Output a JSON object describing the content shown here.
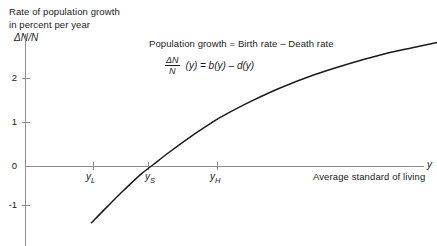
{
  "chart_data": {
    "type": "line",
    "title": "",
    "ylabel": "Rate of population growth in percent per year",
    "ylabel_symbol": "ΔN/N",
    "xlabel": "Average standard of living",
    "xlabel_symbol": "y",
    "ylim": [
      -1.55,
      2.95
    ],
    "xlim": [
      0,
      10
    ],
    "grid": false,
    "legend": null,
    "y_ticks": [
      {
        "value": 2,
        "label": "2"
      },
      {
        "value": 1,
        "label": "1"
      },
      {
        "value": 0,
        "label": "0"
      },
      {
        "value": -1,
        "label": "-1"
      }
    ],
    "x_ticks": [
      {
        "value": 1.7,
        "label": "y",
        "sub": "L"
      },
      {
        "value": 3.1,
        "label": "y",
        "sub": "S"
      },
      {
        "value": 4.8,
        "label": "y",
        "sub": "H"
      }
    ],
    "series": [
      {
        "name": "Population growth rate",
        "x": [
          1.6,
          2.0,
          2.4,
          2.8,
          3.1,
          3.5,
          4.0,
          4.5,
          4.8,
          5.5,
          6.2,
          7.0,
          7.8,
          8.6,
          9.4,
          10.0
        ],
        "values": [
          -1.28,
          -0.9,
          -0.53,
          -0.18,
          0.04,
          0.33,
          0.67,
          0.98,
          1.15,
          1.49,
          1.79,
          2.08,
          2.32,
          2.53,
          2.7,
          2.82
        ]
      }
    ],
    "annotations": {
      "statement": "Population growth = Birth rate – Death rate",
      "equation_numerator": "ΔN",
      "equation_denominator": "N",
      "equation_rhs": "(y) = b(y) – d(y)"
    },
    "colors": {
      "curve": "#1a1a1a",
      "axis": "#8c8c8c",
      "text": "#1a1a1a",
      "background": "#ffffff"
    }
  },
  "ylabel_lines": {
    "line1": "Rate of population growth",
    "line2": "in percent per year"
  }
}
